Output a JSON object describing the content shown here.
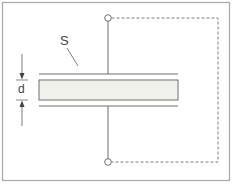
{
  "diagram": {
    "type": "parallel-plate capacitor with dielectric slab",
    "labels": {
      "area": "S",
      "thickness": "d"
    },
    "colors": {
      "border": "#9a9a9a",
      "line": "#6e6e6e",
      "dashed": "#7a7a7a",
      "slab_fill": "#f1f1ec",
      "background": "#ffffff"
    }
  }
}
